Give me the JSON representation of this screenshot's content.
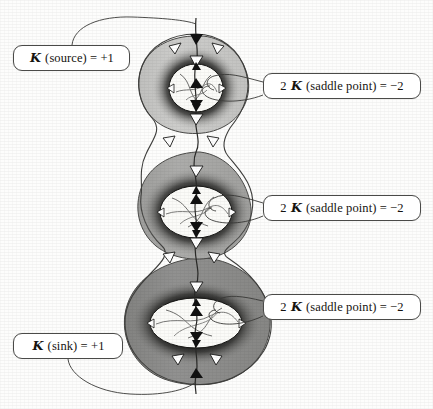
{
  "figure": {
    "background_color": "#fdfdfc"
  },
  "labels": [
    {
      "id": "source",
      "name": "label-source",
      "text": "ℐ (source) = +1",
      "prefix": "",
      "symbol": "ℐ",
      "body": " (source) = +1",
      "value": "+1"
    },
    {
      "id": "saddle-top",
      "name": "label-saddle-top",
      "text": "2 ℐ (saddle point) = −2",
      "prefix": "2 ",
      "symbol": "ℐ",
      "body": " (saddle point) = −2",
      "value": "−2"
    },
    {
      "id": "saddle-middle",
      "name": "label-saddle-middle",
      "text": "2 ℐ (saddle point) = −2",
      "prefix": "2 ",
      "symbol": "ℐ",
      "body": " (saddle point) = −2",
      "value": "−2"
    },
    {
      "id": "saddle-bottom",
      "name": "label-saddle-bottom",
      "text": "2 ℐ (saddle point) = −2",
      "prefix": "2 ",
      "symbol": "ℐ",
      "body": " (saddle point) = −2",
      "value": "−2"
    },
    {
      "id": "sink",
      "name": "label-sink",
      "text": "ℐ (sink) = +1",
      "prefix": "",
      "symbol": "ℐ",
      "body": " (sink) = +1",
      "value": "+1"
    }
  ],
  "colors": {
    "background": "#fdfdfc",
    "lobe_top_fill": "#c9c9c7",
    "lobe_middle_fill": "#a8a8a6",
    "lobe_bottom_fill": "#8d8d8b",
    "halo": "#0d0d0d",
    "hole_fill": "#fbfbf8",
    "stroke": "#3a3a38",
    "label_border": "#4a4a48",
    "label_fill": "#ffffff",
    "text": "#15130f",
    "arrow_filled": "#111111",
    "arrow_hollow": "#ffffff"
  },
  "diagram": {
    "lobes": [
      {
        "name": "lobe-top",
        "cy": 88,
        "hole_rx": 27,
        "hole_ry": 24,
        "fill": "#c9c9c7",
        "index_text": "saddle"
      },
      {
        "name": "lobe-middle",
        "cy": 212,
        "hole_rx": 36,
        "hole_ry": 26,
        "fill": "#a8a8a6",
        "index_text": "saddle"
      },
      {
        "name": "lobe-bottom",
        "cy": 323,
        "hole_rx": 46,
        "hole_ry": 25,
        "fill": "#8d8d8b",
        "index_text": "saddle"
      }
    ],
    "flow_arrows": {
      "filled_count": 6,
      "hollow_count": 12,
      "description": "vector field flow markers along integral curves"
    },
    "leader_lines": 5
  }
}
